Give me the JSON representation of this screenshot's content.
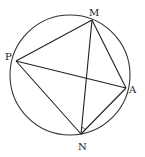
{
  "diagram": {
    "type": "geometry",
    "circle": {
      "cx": 70,
      "cy": 75,
      "r": 60,
      "stroke": "#333333"
    },
    "points": {
      "M": {
        "label": "M",
        "x": 92,
        "y": 20,
        "lx": 89,
        "ly": 16
      },
      "P": {
        "label": "P",
        "x": 16,
        "y": 61,
        "lx": 5,
        "ly": 60
      },
      "A": {
        "label": "A",
        "x": 126,
        "y": 88,
        "lx": 129,
        "ly": 93
      },
      "N": {
        "label": "N",
        "x": 81,
        "y": 134,
        "lx": 78,
        "ly": 150
      }
    },
    "segments": [
      [
        "P",
        "M"
      ],
      [
        "M",
        "A"
      ],
      [
        "A",
        "N"
      ],
      [
        "N",
        "P"
      ],
      [
        "P",
        "A"
      ],
      [
        "M",
        "N"
      ]
    ],
    "angle_mark": {
      "vertex": "N",
      "between": [
        "M",
        "A"
      ]
    },
    "line_color": "#222222"
  }
}
